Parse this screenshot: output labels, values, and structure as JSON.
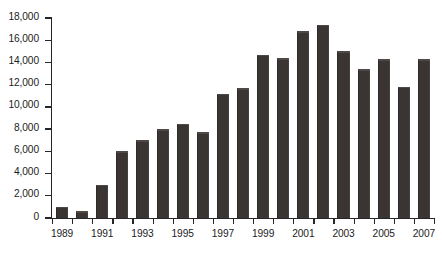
{
  "chart_data": {
    "type": "bar",
    "title": "",
    "subtitle": "",
    "xlabel": "",
    "ylabel": "",
    "categories": [
      "1989",
      "1990",
      "1991",
      "1992",
      "1993",
      "1994",
      "1995",
      "1996",
      "1997",
      "1998",
      "1999",
      "2000",
      "2001",
      "2002",
      "2003",
      "2004",
      "2005",
      "2006",
      "2007"
    ],
    "values": [
      1000,
      600,
      3000,
      6000,
      7000,
      8000,
      8500,
      7700,
      11200,
      11700,
      14700,
      14400,
      16800,
      17400,
      15000,
      13400,
      14300,
      11800,
      14300
    ],
    "ylim": [
      0,
      18000
    ],
    "ytick_values": [
      0,
      2000,
      4000,
      6000,
      8000,
      10000,
      12000,
      14000,
      16000,
      18000
    ],
    "ytick_labels": [
      "0",
      "2,000",
      "4,000",
      "6,000",
      "8,000",
      "10,000",
      "12,000",
      "14,000",
      "16,000",
      "18,000"
    ],
    "xtick_labels": [
      "1989",
      "1991",
      "1993",
      "1995",
      "1997",
      "1999",
      "2001",
      "2003",
      "2005",
      "2007"
    ],
    "xtick_label_years": [
      1989,
      1991,
      1993,
      1995,
      1997,
      1999,
      2001,
      2003,
      2005,
      2007
    ],
    "grid": false,
    "legend": null,
    "legend_position": "none",
    "series": [
      {
        "name": "",
        "color": "#3a3432",
        "values": [
          1000,
          600,
          3000,
          6000,
          7000,
          8000,
          8500,
          7700,
          11200,
          11700,
          14700,
          14400,
          16800,
          17400,
          15000,
          13400,
          14300,
          11800,
          14300
        ]
      }
    ],
    "colors": {
      "bar": "#3a3432",
      "axis": "#262626",
      "text": "#1c1c1c",
      "background": "#ffffff"
    }
  }
}
